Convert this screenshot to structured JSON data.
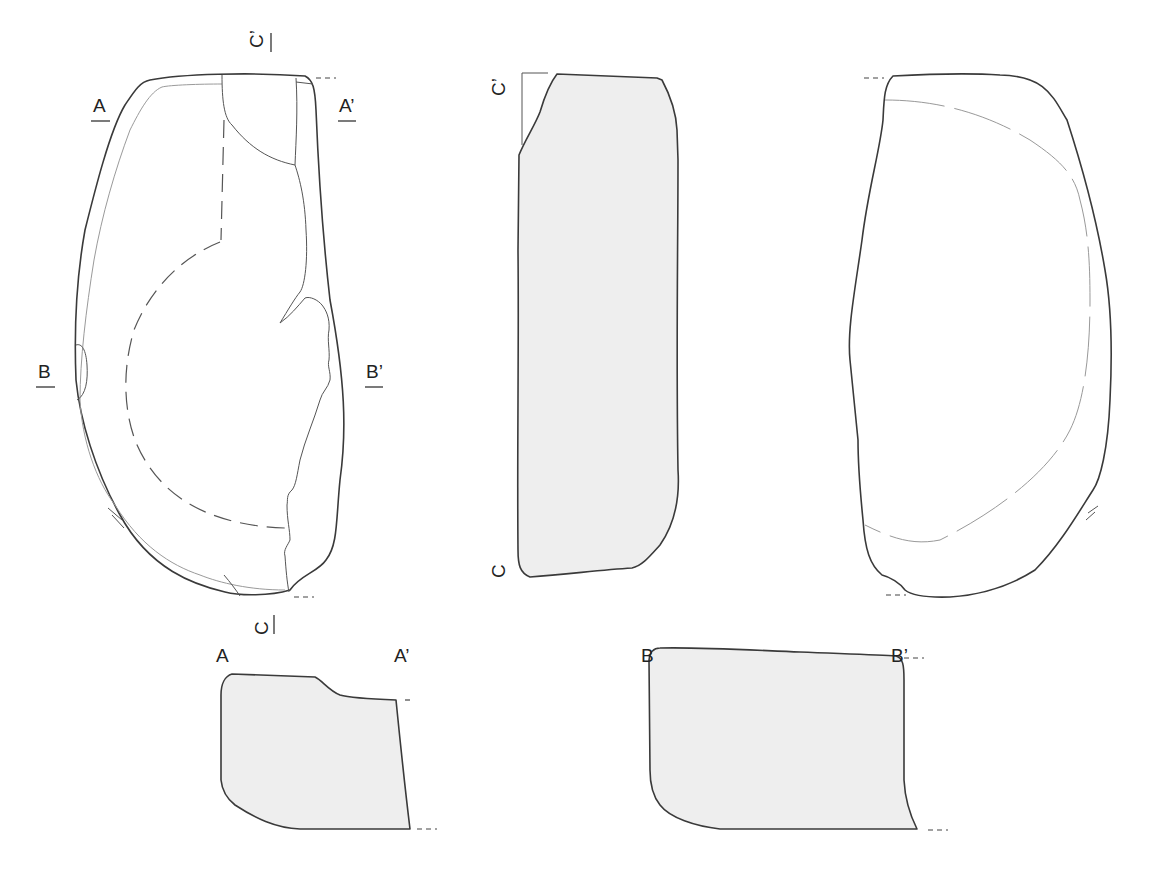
{
  "figure": {
    "colors": {
      "outline": "#3a3a3a",
      "section_fill": "#eeeeee",
      "background": "#ffffff"
    },
    "views": [
      {
        "id": "front",
        "label": "Front view with section markers"
      },
      {
        "id": "profile",
        "label": "Longitudinal section C–C'"
      },
      {
        "id": "back",
        "label": "Back view"
      },
      {
        "id": "section-a",
        "label": "Cross-section A–A'"
      },
      {
        "id": "section-b",
        "label": "Cross-section B–B'"
      }
    ],
    "labels": {
      "a": "A",
      "a_prime": "A’",
      "b": "B",
      "b_prime": "B’",
      "c": "C",
      "c_prime": "C’"
    }
  }
}
